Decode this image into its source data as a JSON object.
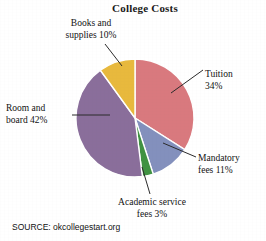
{
  "chart_data": {
    "type": "pie",
    "title": "College Costs",
    "xlabel": "",
    "ylabel": "",
    "categories": [
      "Tuition",
      "Mandatory fees",
      "Academic service fees",
      "Room and board",
      "Books and supplies"
    ],
    "values": [
      34,
      11,
      3,
      42,
      10
    ],
    "value_unit": "%",
    "labels": [
      "Tuition 34%",
      "Mandatory fees 11%",
      "Academic service fees 3%",
      "Room and board 42%",
      "Books and supplies 10%"
    ],
    "colors": [
      "#d9797e",
      "#8390bd",
      "#4a9a4f",
      "#8a6e9b",
      "#e8b càn"
    ],
    "legend_position": "callout-labels",
    "grid": false,
    "start_angle_deg": 0,
    "direction": "clockwise",
    "source": "SOURCE: okcollegestart.org"
  },
  "title": {
    "text": "College Costs"
  },
  "slices": [
    {
      "key": "tuition",
      "name": "Tuition",
      "percent": 34,
      "color": "#d9797e",
      "label_line1": "Tuition",
      "label_line2": "34%"
    },
    {
      "key": "mandatory",
      "name": "Mandatory fees",
      "percent": 11,
      "color": "#8390bd",
      "label_line1": "Mandatory",
      "label_line2": "fees 11%"
    },
    {
      "key": "academic",
      "name": "Academic service fees",
      "percent": 3,
      "color": "#3f9243",
      "label_line1": "Academic service",
      "label_line2": "fees 3%"
    },
    {
      "key": "room",
      "name": "Room and board",
      "percent": 42,
      "color": "#8a6e9b",
      "label_line1": "Room and",
      "label_line2": "board 42%"
    },
    {
      "key": "books",
      "name": "Books and supplies",
      "percent": 10,
      "color": "#e8b93c",
      "label_line1": "Books and",
      "label_line2": "supplies 10%"
    }
  ],
  "footer": {
    "source": "SOURCE: okcollegestart.org"
  },
  "palette": {
    "tuition": "#d9797e",
    "mandatory_fees": "#8390bd",
    "academic_service_fees": "#3f9243",
    "room_and_board": "#8a6e9b",
    "books_and_supplies": "#e8b93c",
    "background": "#ffffff",
    "text": "#111111",
    "leader_line": "#2b2b2b"
  }
}
